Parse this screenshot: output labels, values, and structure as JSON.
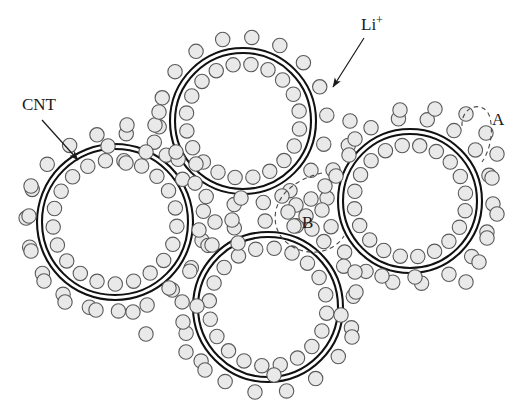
{
  "figure": {
    "background_color": "#ffffff",
    "width": 522,
    "height": 403
  },
  "style": {
    "tube_wall_color": "#111111",
    "tube_wall_width": 2.1,
    "tube_wall_gap": 5,
    "ion_fill": "#e9e9e9",
    "ion_stroke": "#595959",
    "ion_stroke_width": 1.1,
    "ion_radius": 7.2,
    "annotation_color": "#1a1a1a",
    "dashed_color": "#4a4a4a"
  },
  "labels": [
    {
      "id": "cnt",
      "text": "CNT",
      "x": 22,
      "y": 110,
      "font_size": 17,
      "arrow": {
        "x1": 42,
        "y1": 120,
        "x2": 78,
        "y2": 160
      }
    },
    {
      "id": "li-ion",
      "text": "Li",
      "superscript": "+",
      "x": 361,
      "y": 30,
      "font_size": 17,
      "arrow": {
        "x1": 364,
        "y1": 38,
        "x2": 333,
        "y2": 87
      }
    },
    {
      "id": "region-a",
      "text": "A",
      "x": 492,
      "y": 125,
      "font_size": 17
    },
    {
      "id": "region-b",
      "text": "B",
      "x": 302,
      "y": 228,
      "font_size": 17
    }
  ],
  "nanotubes": [
    {
      "id": "cnt-top",
      "cx": 243,
      "cy": 121,
      "outer_r": 73,
      "inner_r": 68,
      "ion_ring_inner_r": 57,
      "ion_ring_outer_r": 84,
      "inner_ion_count": 20,
      "outer_ion_count": 18,
      "inner_phase": 8,
      "outer_phase": 16
    },
    {
      "id": "cnt-left",
      "cx": 115,
      "cy": 222,
      "outer_r": 78,
      "inner_r": 73,
      "ion_ring_inner_r": 62,
      "ion_ring_outer_r": 89,
      "inner_ion_count": 21,
      "outer_ion_count": 19,
      "inner_phase": 4,
      "outer_phase": 12
    },
    {
      "id": "cnt-right",
      "cx": 410,
      "cy": 201,
      "outer_r": 72,
      "inner_r": 67,
      "ion_ring_inner_r": 56,
      "ion_ring_outer_r": 83,
      "inner_ion_count": 20,
      "outer_ion_count": 18,
      "inner_phase": 10,
      "outer_phase": 2
    },
    {
      "id": "cnt-bottom",
      "cx": 268,
      "cy": 307,
      "outer_r": 75,
      "inner_r": 70,
      "ion_ring_inner_r": 59,
      "ion_ring_outer_r": 86,
      "inner_ion_count": 20,
      "outer_ion_count": 17,
      "inner_phase": 6,
      "outer_phase": 14
    }
  ],
  "free_ions": [
    {
      "x": 155,
      "y": 125
    },
    {
      "x": 127,
      "y": 125
    },
    {
      "x": 108,
      "y": 146
    },
    {
      "x": 146,
      "y": 152
    },
    {
      "x": 176,
      "y": 152
    },
    {
      "x": 126,
      "y": 163
    },
    {
      "x": 196,
      "y": 164
    },
    {
      "x": 159,
      "y": 112
    },
    {
      "x": 232,
      "y": 220
    },
    {
      "x": 241,
      "y": 198
    },
    {
      "x": 215,
      "y": 222
    },
    {
      "x": 238,
      "y": 243
    },
    {
      "x": 212,
      "y": 245
    },
    {
      "x": 199,
      "y": 230
    },
    {
      "x": 282,
      "y": 196
    },
    {
      "x": 296,
      "y": 205
    },
    {
      "x": 311,
      "y": 199
    },
    {
      "x": 288,
      "y": 212
    },
    {
      "x": 306,
      "y": 216
    },
    {
      "x": 322,
      "y": 210
    },
    {
      "x": 294,
      "y": 226
    },
    {
      "x": 312,
      "y": 229
    },
    {
      "x": 325,
      "y": 186
    },
    {
      "x": 336,
      "y": 176
    },
    {
      "x": 350,
      "y": 121
    },
    {
      "x": 355,
      "y": 139
    },
    {
      "x": 349,
      "y": 155
    },
    {
      "x": 400,
      "y": 110
    },
    {
      "x": 435,
      "y": 109
    },
    {
      "x": 466,
      "y": 114
    },
    {
      "x": 486,
      "y": 133
    },
    {
      "x": 497,
      "y": 154
    },
    {
      "x": 492,
      "y": 178
    },
    {
      "x": 497,
      "y": 214
    },
    {
      "x": 487,
      "y": 238
    },
    {
      "x": 479,
      "y": 262
    },
    {
      "x": 466,
      "y": 282
    },
    {
      "x": 415,
      "y": 277
    },
    {
      "x": 382,
      "y": 276
    },
    {
      "x": 355,
      "y": 272
    },
    {
      "x": 356,
      "y": 292
    },
    {
      "x": 341,
      "y": 315
    },
    {
      "x": 352,
      "y": 337
    },
    {
      "x": 197,
      "y": 306
    },
    {
      "x": 183,
      "y": 322
    },
    {
      "x": 169,
      "y": 288
    },
    {
      "x": 96,
      "y": 310
    },
    {
      "x": 133,
      "y": 312
    },
    {
      "x": 146,
      "y": 334
    },
    {
      "x": 31,
      "y": 186
    },
    {
      "x": 29,
      "y": 216
    },
    {
      "x": 31,
      "y": 251
    },
    {
      "x": 44,
      "y": 281
    },
    {
      "x": 65,
      "y": 302
    },
    {
      "x": 186,
      "y": 352
    },
    {
      "x": 205,
      "y": 370
    },
    {
      "x": 274,
      "y": 375
    }
  ],
  "dashed_regions": [
    {
      "id": "region-a-arc",
      "shape": "hop-arc",
      "description": "dashed arc linking two surface ions indicating ion hopping",
      "path": "M 462,126 C 461,104 486,100 490,118 C 494,134 489,152 482,162"
    },
    {
      "id": "region-b-outline",
      "shape": "pore-boundary",
      "description": "dashed boundary enclosing ions in interstitial pore between tubes",
      "path": "M 322,173 C 300,178 281,190 276,210 C 272,228 282,244 300,250 C 318,256 336,249 344,236"
    }
  ]
}
